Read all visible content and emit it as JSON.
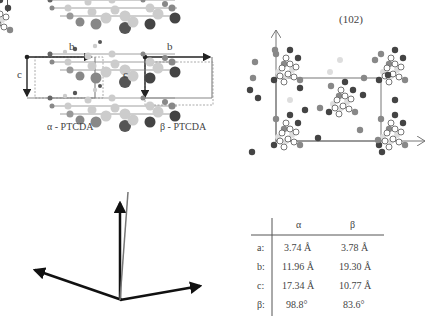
{
  "figure": {
    "page_mark": "|",
    "panel_a": {
      "alpha": {
        "label": "α - PTCDA",
        "axis_b": "b",
        "axis_c": "c"
      },
      "beta": {
        "label": "β - PTCDA",
        "axis_b": "b",
        "axis_c": "c"
      }
    },
    "panel_b": {
      "plane_label": "(102)"
    },
    "panel_c": {
      "description": "stacked PTCDA molecules with axes"
    },
    "table": {
      "headers": [
        "",
        "α",
        "β"
      ],
      "rows": [
        {
          "param": "a:",
          "alpha": "3.74 Å",
          "beta": "3.78 Å"
        },
        {
          "param": "b:",
          "alpha": "11.96 Å",
          "beta": "19.30 Å"
        },
        {
          "param": "c:",
          "alpha": "17.34 Å",
          "beta": "10.77 Å"
        },
        {
          "param": "β:",
          "alpha": "98.8°",
          "beta": "83.6°"
        }
      ]
    }
  },
  "colors": {
    "dark": "#444444",
    "mid": "#888888",
    "light": "#c8c8c8",
    "line": "#555555"
  }
}
